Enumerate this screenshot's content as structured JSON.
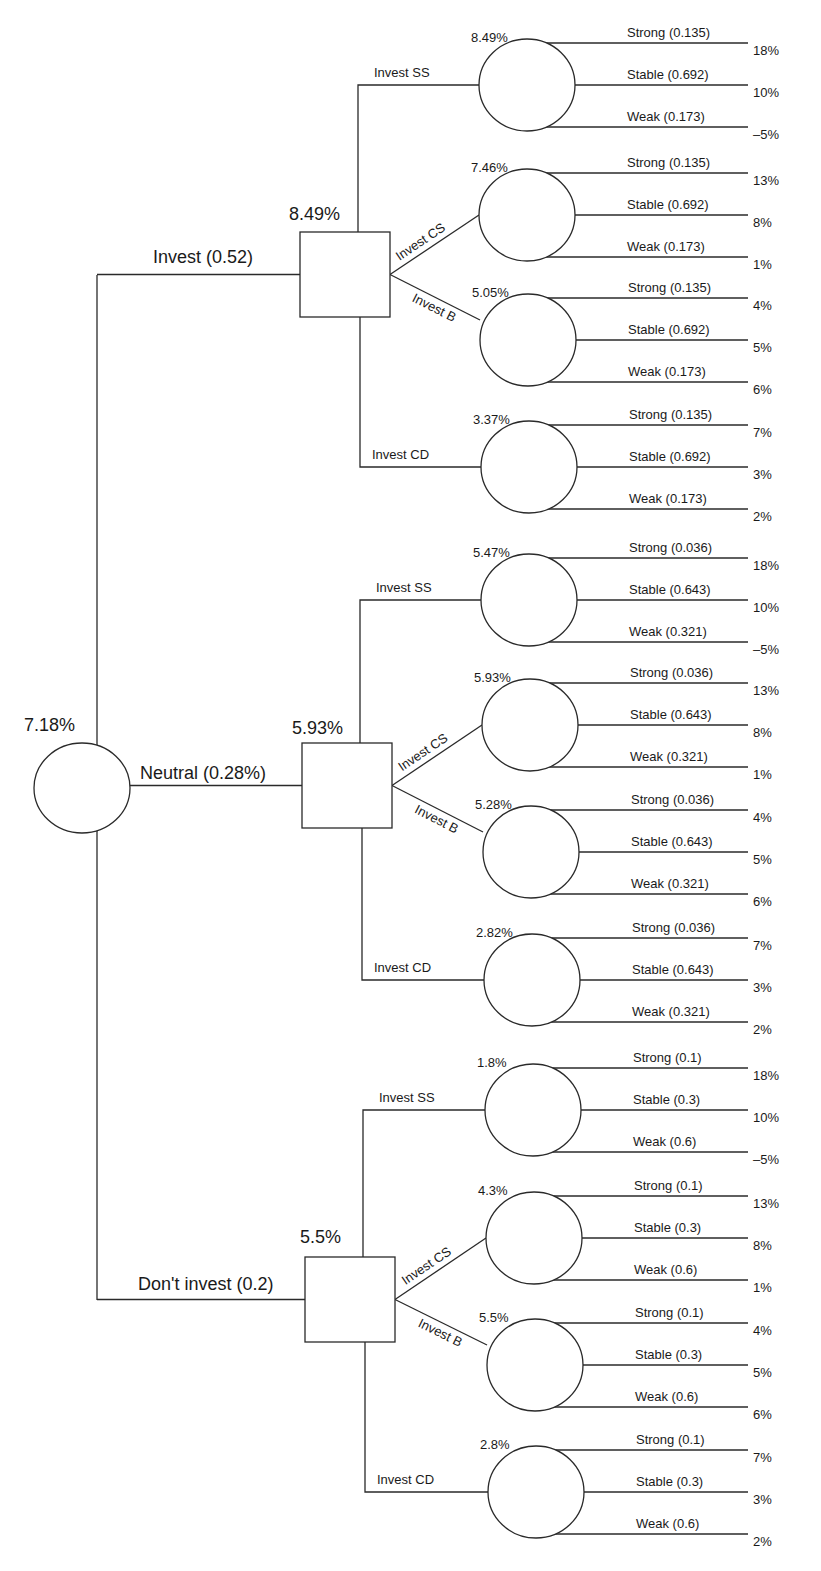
{
  "diagram": {
    "type": "decision-tree",
    "root": {
      "value": "7.18%",
      "branches": [
        {
          "label": "Invest (0.52)",
          "decision_value": "8.49%",
          "options": [
            {
              "label": "Invest SS",
              "value": "8.49%",
              "outcomes": [
                {
                  "label": "Strong (0.135)",
                  "payoff": "18%"
                },
                {
                  "label": "Stable (0.692)",
                  "payoff": "10%"
                },
                {
                  "label": "Weak (0.173)",
                  "payoff": "–5%"
                }
              ]
            },
            {
              "label": "Invest CS",
              "value": "7.46%",
              "outcomes": [
                {
                  "label": "Strong (0.135)",
                  "payoff": "13%"
                },
                {
                  "label": "Stable (0.692)",
                  "payoff": "8%"
                },
                {
                  "label": "Weak (0.173)",
                  "payoff": "1%"
                }
              ]
            },
            {
              "label": "Invest B",
              "value": "5.05%",
              "outcomes": [
                {
                  "label": "Strong (0.135)",
                  "payoff": "4%"
                },
                {
                  "label": "Stable (0.692)",
                  "payoff": "5%"
                },
                {
                  "label": "Weak (0.173)",
                  "payoff": "6%"
                }
              ]
            },
            {
              "label": "Invest CD",
              "value": "3.37%",
              "outcomes": [
                {
                  "label": "Strong (0.135)",
                  "payoff": "7%"
                },
                {
                  "label": "Stable (0.692)",
                  "payoff": "3%"
                },
                {
                  "label": "Weak (0.173)",
                  "payoff": "2%"
                }
              ]
            }
          ]
        },
        {
          "label": "Neutral (0.28%)",
          "decision_value": "5.93%",
          "options": [
            {
              "label": "Invest SS",
              "value": "5.47%",
              "outcomes": [
                {
                  "label": "Strong (0.036)",
                  "payoff": "18%"
                },
                {
                  "label": "Stable (0.643)",
                  "payoff": "10%"
                },
                {
                  "label": "Weak (0.321)",
                  "payoff": "–5%"
                }
              ]
            },
            {
              "label": "Invest CS",
              "value": "5.93%",
              "outcomes": [
                {
                  "label": "Strong (0.036)",
                  "payoff": "13%"
                },
                {
                  "label": "Stable (0.643)",
                  "payoff": "8%"
                },
                {
                  "label": "Weak (0.321)",
                  "payoff": "1%"
                }
              ]
            },
            {
              "label": "Invest B",
              "value": "5.28%",
              "outcomes": [
                {
                  "label": "Strong (0.036)",
                  "payoff": "4%"
                },
                {
                  "label": "Stable (0.643)",
                  "payoff": "5%"
                },
                {
                  "label": "Weak (0.321)",
                  "payoff": "6%"
                }
              ]
            },
            {
              "label": "Invest CD",
              "value": "2.82%",
              "outcomes": [
                {
                  "label": "Strong (0.036)",
                  "payoff": "7%"
                },
                {
                  "label": "Stable (0.643)",
                  "payoff": "3%"
                },
                {
                  "label": "Weak (0.321)",
                  "payoff": "2%"
                }
              ]
            }
          ]
        },
        {
          "label": "Don't invest (0.2)",
          "decision_value": "5.5%",
          "options": [
            {
              "label": "Invest SS",
              "value": "1.8%",
              "outcomes": [
                {
                  "label": "Strong (0.1)",
                  "payoff": "18%"
                },
                {
                  "label": "Stable (0.3)",
                  "payoff": "10%"
                },
                {
                  "label": "Weak (0.6)",
                  "payoff": "–5%"
                }
              ]
            },
            {
              "label": "Invest CS",
              "value": "4.3%",
              "outcomes": [
                {
                  "label": "Strong (0.1)",
                  "payoff": "13%"
                },
                {
                  "label": "Stable (0.3)",
                  "payoff": "8%"
                },
                {
                  "label": "Weak (0.6)",
                  "payoff": "1%"
                }
              ]
            },
            {
              "label": "Invest B",
              "value": "5.5%",
              "outcomes": [
                {
                  "label": "Strong (0.1)",
                  "payoff": "4%"
                },
                {
                  "label": "Stable (0.3)",
                  "payoff": "5%"
                },
                {
                  "label": "Weak (0.6)",
                  "payoff": "6%"
                }
              ]
            },
            {
              "label": "Invest CD",
              "value": "2.8%",
              "outcomes": [
                {
                  "label": "Strong (0.1)",
                  "payoff": "7%"
                },
                {
                  "label": "Stable (0.3)",
                  "payoff": "3%"
                },
                {
                  "label": "Weak (0.6)",
                  "payoff": "2%"
                }
              ]
            }
          ]
        }
      ]
    }
  }
}
